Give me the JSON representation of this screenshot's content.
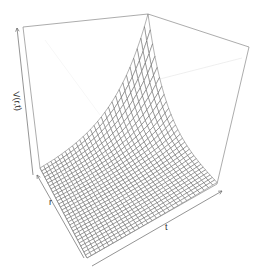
{
  "chart_data": {
    "type": "surface3d",
    "title": "",
    "xlabel": "r",
    "ylabel": "t",
    "zlabel": "V(r,t)",
    "grid": false,
    "legend": null,
    "ticks": "none (axis arrows only)",
    "mesh": {
      "r_lines": 30,
      "t_lines": 30
    },
    "surface_shape": {
      "function_hint": "V = exp(-k*r) * g(t), approximately exponential growth toward one corner",
      "min_value_relative": 0.0,
      "max_value_relative": 1.0,
      "peak_corner": "back-left (top of box)",
      "flat_region": "front / right"
    },
    "view": {
      "theta": -30,
      "phi": 20,
      "box": true
    }
  },
  "labels": {
    "z_axis": "V(r,t)",
    "x_axis": "r",
    "y_axis": "t"
  },
  "colors": {
    "mesh": "#555555",
    "box": "#888888",
    "box_hidden": "#dddddd",
    "background": "#ffffff"
  }
}
